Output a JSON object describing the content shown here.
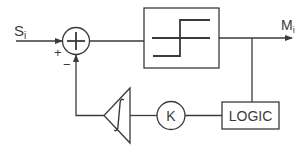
{
  "diagram": {
    "input_label": "S",
    "input_subscript": "i",
    "output_label": "M",
    "output_subscript": "i",
    "sum_plus_sign": "+",
    "sum_minus_sign": "−",
    "gain_label": "K",
    "logic_label": "LOGIC",
    "blocks": [
      {
        "id": "summing-junction",
        "type": "circle",
        "symbol": "plus"
      },
      {
        "id": "relay",
        "type": "box",
        "symbol": "hysteresis-step"
      },
      {
        "id": "logic",
        "type": "box",
        "label": "LOGIC"
      },
      {
        "id": "gain",
        "type": "circle",
        "label": "K"
      },
      {
        "id": "integrator",
        "type": "triangle",
        "symbol": "integral"
      }
    ],
    "colors": {
      "stroke": "#3a3a3a",
      "background": "#ffffff"
    }
  }
}
